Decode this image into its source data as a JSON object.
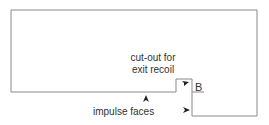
{
  "diagram": {
    "labels": {
      "cutout_line1": "cut-out for",
      "cutout_line2": "exit recoil",
      "impulse": "impulse faces",
      "point_b": "B"
    },
    "colors": {
      "outline": "#8a8a8a",
      "text": "#333333",
      "arrow": "#222222",
      "background": "#ffffff"
    }
  }
}
